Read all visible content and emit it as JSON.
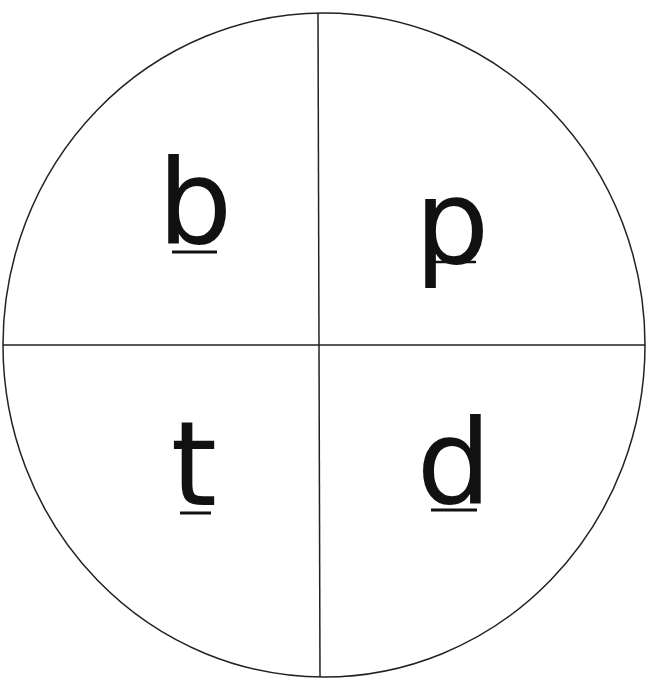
{
  "caption": "",
  "wheel": {
    "quadrants": [
      {
        "position": "top-left",
        "letter": "b",
        "underline": "below"
      },
      {
        "position": "top-right",
        "letter": "p",
        "underline": "through-middle"
      },
      {
        "position": "bottom-left",
        "letter": "t",
        "underline": "below"
      },
      {
        "position": "bottom-right",
        "letter": "d",
        "underline": "below"
      }
    ],
    "stroke_color": "#222222",
    "letter_color": "#111111"
  }
}
